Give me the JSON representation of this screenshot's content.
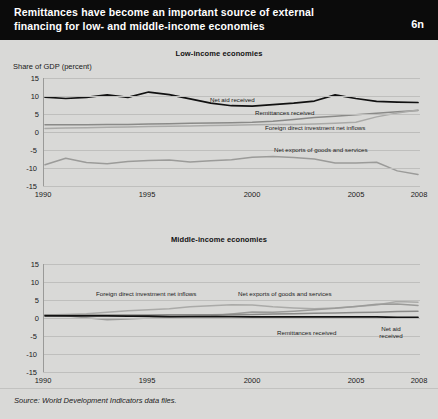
{
  "header": {
    "title": "Remittances have become an important source of external financing for low- and middle-income economies",
    "badge": "6n"
  },
  "axis_label": "Share of GDP (percent)",
  "source": "Source: World Development Indicators data files.",
  "colors": {
    "background": "#d9d9d7",
    "titlebar": "#0b0b0b",
    "net_aid": "#111111",
    "remittances": "#8a8a88",
    "fdi": "#aaaaa8",
    "net_exports": "#9b9b99",
    "gridline": "#bfbfbd"
  },
  "panels": [
    {
      "title": "Low-income economies",
      "yticks": [
        "15",
        "10",
        "5",
        "0",
        "-5",
        "-10",
        "-15"
      ],
      "xticks": [
        "1990",
        "1995",
        "2000",
        "2005",
        "2008"
      ],
      "labels": {
        "net_aid": "Net aid received",
        "remittances": "Remittances received",
        "fdi": "Foreign direct investment net inflows",
        "net_exports": "Net exports of goods and services"
      }
    },
    {
      "title": "Middle-income economies",
      "yticks": [
        "15",
        "10",
        "5",
        "0",
        "-5",
        "-10",
        "-15"
      ],
      "xticks": [
        "1990",
        "1995",
        "2000",
        "2005",
        "2008"
      ],
      "labels": {
        "net_aid": "Net aid received",
        "remittances": "Remittances received",
        "fdi": "Foreign direct investment net inflows",
        "net_exports": "Net exports of goods and services"
      }
    }
  ],
  "chart_data": [
    {
      "type": "line",
      "title": "Low-income economies",
      "xlabel": "",
      "ylabel": "Share of GDP (percent)",
      "ylim": [
        -15,
        15
      ],
      "xlim": [
        1990,
        2008
      ],
      "yticks": [
        15,
        10,
        5,
        0,
        -5,
        -10,
        -15
      ],
      "xticks": [
        1990,
        1995,
        2000,
        2005,
        2008
      ],
      "grid": true,
      "legend": "inline-annotations",
      "x": [
        1990,
        1991,
        1992,
        1993,
        1994,
        1995,
        1996,
        1997,
        1998,
        1999,
        2000,
        2001,
        2002,
        2003,
        2004,
        2005,
        2006,
        2007,
        2008
      ],
      "series": [
        {
          "name": "Net aid received",
          "color": "#111111",
          "values": [
            9.7,
            9.3,
            9.6,
            10.3,
            9.6,
            11.1,
            10.4,
            9.2,
            8.0,
            7.3,
            7.2,
            7.6,
            8.0,
            8.6,
            10.3,
            9.3,
            8.5,
            8.3,
            8.2
          ]
        },
        {
          "name": "Remittances received",
          "color": "#8a8a88",
          "values": [
            2.0,
            2.0,
            2.0,
            2.1,
            2.1,
            2.2,
            2.3,
            2.4,
            2.5,
            2.6,
            2.7,
            3.0,
            3.5,
            4.0,
            4.4,
            4.8,
            5.2,
            5.6,
            6.0
          ]
        },
        {
          "name": "Foreign direct investment net inflows",
          "color": "#aaaaa8",
          "values": [
            1.0,
            1.1,
            1.2,
            1.3,
            1.4,
            1.5,
            1.6,
            1.7,
            1.8,
            1.9,
            2.0,
            2.1,
            2.1,
            2.2,
            2.4,
            2.7,
            4.2,
            5.3,
            6.1
          ]
        },
        {
          "name": "Net exports of goods and services",
          "color": "#9b9b99",
          "values": [
            -9.1,
            -7.3,
            -8.5,
            -8.8,
            -8.2,
            -7.9,
            -7.8,
            -8.3,
            -8.0,
            -7.7,
            -7.0,
            -6.8,
            -7.1,
            -7.5,
            -8.6,
            -8.6,
            -8.4,
            -10.8,
            -11.8
          ]
        }
      ]
    },
    {
      "type": "line",
      "title": "Middle-income economies",
      "xlabel": "",
      "ylabel": "Share of GDP (percent)",
      "ylim": [
        -15,
        15
      ],
      "xlim": [
        1990,
        2008
      ],
      "yticks": [
        15,
        10,
        5,
        0,
        -5,
        -10,
        -15
      ],
      "xticks": [
        1990,
        1995,
        2000,
        2005,
        2008
      ],
      "grid": true,
      "legend": "inline-annotations",
      "x": [
        1990,
        1991,
        1992,
        1993,
        1994,
        1995,
        1996,
        1997,
        1998,
        1999,
        2000,
        2001,
        2002,
        2003,
        2004,
        2005,
        2006,
        2007,
        2008
      ],
      "series": [
        {
          "name": "Foreign direct investment net inflows",
          "color": "#aaaaa8",
          "values": [
            0.8,
            1.0,
            1.2,
            1.6,
            2.0,
            2.3,
            2.6,
            3.1,
            3.4,
            3.7,
            3.6,
            3.1,
            2.8,
            2.6,
            2.8,
            3.2,
            3.6,
            4.6,
            4.4
          ]
        },
        {
          "name": "Net exports of goods and services",
          "color": "#9b9b99",
          "values": [
            0.8,
            0.6,
            0.1,
            -0.5,
            -0.3,
            0.0,
            0.3,
            0.5,
            0.6,
            1.1,
            1.7,
            1.6,
            1.9,
            2.3,
            2.7,
            3.2,
            3.8,
            3.9,
            3.5
          ]
        },
        {
          "name": "Remittances received",
          "color": "#8a8a88",
          "values": [
            0.8,
            0.8,
            0.8,
            0.8,
            0.8,
            0.8,
            0.9,
            0.9,
            0.9,
            1.0,
            1.0,
            1.1,
            1.2,
            1.3,
            1.4,
            1.5,
            1.6,
            1.8,
            1.9
          ]
        },
        {
          "name": "Net aid received",
          "color": "#111111",
          "values": [
            0.6,
            0.6,
            0.6,
            0.6,
            0.5,
            0.5,
            0.4,
            0.4,
            0.4,
            0.4,
            0.3,
            0.3,
            0.3,
            0.3,
            0.3,
            0.3,
            0.3,
            0.2,
            0.2
          ]
        }
      ]
    }
  ]
}
